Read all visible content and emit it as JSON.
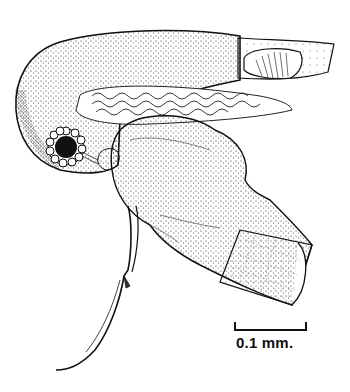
{
  "figure": {
    "type": "stippled biological illustration",
    "colors": {
      "ink": "#111111",
      "background": "#ffffff"
    }
  },
  "scale_bar": {
    "label": "0.1 mm."
  }
}
